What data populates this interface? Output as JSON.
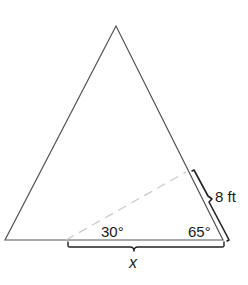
{
  "diagram": {
    "type": "triangle-geometry",
    "triangle": {
      "vertices": {
        "apex": [
          116,
          26
        ],
        "bottom_left": [
          5,
          240
        ],
        "bottom_right": [
          223,
          240
        ]
      },
      "stroke_color": "#555555"
    },
    "dashed_segment": {
      "from": [
        66,
        240
      ],
      "to": [
        186,
        172
      ],
      "stroke_color": "#c8c8c8"
    },
    "labels": {
      "angle_left": "30°",
      "angle_right": "65°",
      "side_length": "8 ft",
      "base_unknown": "x"
    },
    "braces": {
      "right_side": {
        "from": [
          192,
          170
        ],
        "to": [
          229,
          240
        ],
        "label_ref": "side_length"
      },
      "base": {
        "from": [
          68,
          244
        ],
        "to": [
          224,
          244
        ],
        "label_ref": "base_unknown"
      }
    },
    "colors": {
      "line": "#555555",
      "dashed": "#c8c8c8",
      "brace": "#222222",
      "text": "#1a1a1a",
      "background": "#ffffff"
    }
  }
}
